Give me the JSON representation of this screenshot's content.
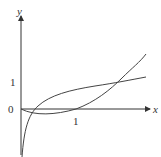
{
  "figure": {
    "axes": {
      "x_label": "x",
      "y_label": "y",
      "origin_label": "0",
      "x_tick": "1",
      "y_tick": "1"
    },
    "curves": [
      {
        "name": "logarithmic-curve",
        "description": "rises steeply from below, crosses x-axis near 0.3, passes (2.4,1)"
      },
      {
        "name": "parabola-curve",
        "description": "starts at origin, dips below x-axis, crosses at 1, rises steeply"
      }
    ],
    "stroke_color": "#444444"
  }
}
